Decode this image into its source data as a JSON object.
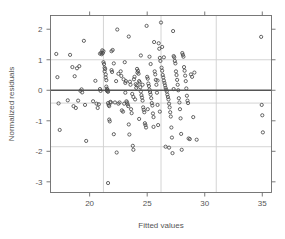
{
  "chart_data": {
    "type": "scatter",
    "title": "",
    "xlabel": "Fitted values",
    "ylabel": "Normalized residuals",
    "xlim": [
      16.6,
      35.8
    ],
    "ylim": [
      -3.35,
      2.45
    ],
    "xticks": [
      20,
      25,
      30,
      35
    ],
    "xtick_labels": [
      "20",
      "25",
      "30",
      "35"
    ],
    "yticks": [
      2,
      1,
      0,
      -1,
      -2,
      -3
    ],
    "ytick_labels": [
      "2",
      "1",
      "0",
      "-1",
      "-2",
      "-3"
    ],
    "grid": true,
    "grid_color": "#cfcfcf",
    "zero_line_y": 0,
    "zero_line_color": "#555555",
    "hgrid_values": [
      1.0,
      -0.42,
      -1.85
    ],
    "vgrid_values": [
      21.2,
      26.2,
      31.0
    ],
    "legend": null,
    "marker": "open-circle",
    "marker_color": "#4a4a4a",
    "marker_size": 3.2,
    "n_points": 208,
    "points": [
      [
        17.1,
        1.19
      ],
      [
        17.2,
        0.43
      ],
      [
        17.3,
        -0.43
      ],
      [
        17.4,
        -1.3
      ],
      [
        18.1,
        -0.33
      ],
      [
        18.3,
        1.16
      ],
      [
        18.5,
        0.76
      ],
      [
        18.6,
        -0.52
      ],
      [
        18.7,
        0.46
      ],
      [
        18.8,
        -0.58
      ],
      [
        18.9,
        0.72
      ],
      [
        19.0,
        -0.34
      ],
      [
        19.1,
        0.79
      ],
      [
        19.2,
        -0.02
      ],
      [
        19.3,
        0.03
      ],
      [
        19.35,
        -0.07
      ],
      [
        19.5,
        1.62
      ],
      [
        19.6,
        -0.48
      ],
      [
        19.7,
        -1.66
      ],
      [
        20.3,
        -0.36
      ],
      [
        20.5,
        0.31
      ],
      [
        20.6,
        -0.44
      ],
      [
        20.7,
        -0.58
      ],
      [
        20.8,
        -0.46
      ],
      [
        20.9,
        0.04
      ],
      [
        20.95,
        -0.02
      ],
      [
        21.0,
        1.23
      ],
      [
        21.05,
        1.18
      ],
      [
        21.1,
        1.31
      ],
      [
        21.15,
        1.22
      ],
      [
        21.2,
        1.28
      ],
      [
        21.2,
        0.92
      ],
      [
        21.25,
        0.86
      ],
      [
        21.3,
        0.74
      ],
      [
        21.3,
        0.62
      ],
      [
        21.35,
        0.7
      ],
      [
        21.4,
        0.52
      ],
      [
        21.4,
        0.42
      ],
      [
        21.45,
        0.33
      ],
      [
        21.45,
        0.12
      ],
      [
        21.5,
        0.05
      ],
      [
        21.5,
        -0.01
      ],
      [
        21.55,
        -0.03
      ],
      [
        21.55,
        0.02
      ],
      [
        21.6,
        -0.05
      ],
      [
        21.6,
        -0.42
      ],
      [
        21.65,
        -0.48
      ],
      [
        21.7,
        -0.52
      ],
      [
        21.7,
        -0.96
      ],
      [
        21.75,
        -1.02
      ],
      [
        21.8,
        -0.38
      ],
      [
        21.85,
        -0.4
      ],
      [
        21.9,
        0.66
      ],
      [
        21.95,
        0.6
      ],
      [
        22.0,
        1.32
      ],
      [
        22.1,
        0.88
      ],
      [
        22.2,
        -0.4
      ],
      [
        22.3,
        0.3
      ],
      [
        22.35,
        -2.04
      ],
      [
        22.4,
        1.99
      ],
      [
        22.5,
        -0.44
      ],
      [
        22.6,
        -0.4
      ],
      [
        22.7,
        0.62
      ],
      [
        22.75,
        0.47
      ],
      [
        22.8,
        -0.66
      ],
      [
        22.9,
        -0.7
      ],
      [
        23.0,
        -0.44
      ],
      [
        23.05,
        0.92
      ],
      [
        23.1,
        0.24
      ],
      [
        23.15,
        0.3
      ],
      [
        23.2,
        -0.36
      ],
      [
        23.25,
        -0.4
      ],
      [
        23.3,
        -0.46
      ],
      [
        23.35,
        -0.52
      ],
      [
        23.4,
        1.76
      ],
      [
        23.45,
        -1.45
      ],
      [
        23.5,
        0.28
      ],
      [
        23.55,
        0.18
      ],
      [
        23.6,
        -0.62
      ],
      [
        23.65,
        -0.75
      ],
      [
        23.7,
        -0.12
      ],
      [
        23.75,
        -1.82
      ],
      [
        23.8,
        -1.95
      ],
      [
        23.85,
        0.36
      ],
      [
        23.9,
        0.44
      ],
      [
        23.95,
        -0.3
      ],
      [
        24.0,
        0.2
      ],
      [
        24.05,
        0.08
      ],
      [
        24.1,
        0.16
      ],
      [
        24.15,
        0.58
      ],
      [
        24.2,
        0.64
      ],
      [
        24.25,
        0.54
      ],
      [
        24.3,
        0.3
      ],
      [
        24.35,
        0.26
      ],
      [
        24.4,
        0.1
      ],
      [
        24.45,
        -0.04
      ],
      [
        24.5,
        -0.16
      ],
      [
        24.55,
        -0.24
      ],
      [
        24.6,
        -0.34
      ],
      [
        24.65,
        -0.56
      ],
      [
        24.7,
        -0.64
      ],
      [
        24.75,
        -0.72
      ],
      [
        24.8,
        -1.08
      ],
      [
        24.85,
        -1.14
      ],
      [
        24.9,
        -1.22
      ],
      [
        24.95,
        2.11
      ],
      [
        25.0,
        0.44
      ],
      [
        25.05,
        0.38
      ],
      [
        25.1,
        0.22
      ],
      [
        25.15,
        0.14
      ],
      [
        25.2,
        0.02
      ],
      [
        25.25,
        -0.06
      ],
      [
        25.3,
        -0.14
      ],
      [
        25.35,
        -0.26
      ],
      [
        25.4,
        -0.42
      ],
      [
        25.45,
        -0.5
      ],
      [
        25.5,
        -0.76
      ],
      [
        25.55,
        -0.88
      ],
      [
        25.6,
        1.58
      ],
      [
        25.65,
        0.62
      ],
      [
        25.7,
        0.52
      ],
      [
        25.75,
        0.34
      ],
      [
        25.8,
        0.18
      ],
      [
        25.85,
        -0.08
      ],
      [
        25.9,
        -0.48
      ],
      [
        25.95,
        -1.14
      ],
      [
        26.0,
        1.54
      ],
      [
        26.05,
        1.36
      ],
      [
        26.1,
        1.06
      ],
      [
        26.15,
        0.96
      ],
      [
        26.2,
        2.22
      ],
      [
        26.25,
        0.74
      ],
      [
        26.3,
        0.64
      ],
      [
        26.35,
        0.5
      ],
      [
        26.4,
        0.42
      ],
      [
        26.45,
        0.32
      ],
      [
        26.5,
        0.24
      ],
      [
        26.55,
        0.16
      ],
      [
        26.6,
        0.08
      ],
      [
        26.65,
        0.02
      ],
      [
        26.7,
        -0.04
      ],
      [
        26.75,
        -0.14
      ],
      [
        26.8,
        -0.22
      ],
      [
        26.85,
        -0.3
      ],
      [
        26.9,
        -0.44
      ],
      [
        26.95,
        -0.56
      ],
      [
        27.0,
        -0.72
      ],
      [
        27.05,
        -0.86
      ],
      [
        27.1,
        -1.22
      ],
      [
        27.15,
        -1.55
      ],
      [
        27.2,
        -2.06
      ],
      [
        27.25,
        1.94
      ],
      [
        27.3,
        1.12
      ],
      [
        27.35,
        1.08
      ],
      [
        27.4,
        0.96
      ],
      [
        27.45,
        0.88
      ],
      [
        27.5,
        0.62
      ],
      [
        27.55,
        0.5
      ],
      [
        27.6,
        0.34
      ],
      [
        27.65,
        0.18
      ],
      [
        27.7,
        0.0
      ],
      [
        27.75,
        -0.26
      ],
      [
        27.8,
        -0.4
      ],
      [
        27.85,
        -0.62
      ],
      [
        27.9,
        -0.92
      ],
      [
        27.95,
        -1.43
      ],
      [
        28.0,
        -1.95
      ],
      [
        28.05,
        1.22
      ],
      [
        28.1,
        1.16
      ],
      [
        28.15,
        1.1
      ],
      [
        28.2,
        0.76
      ],
      [
        28.25,
        0.64
      ],
      [
        28.3,
        0.48
      ],
      [
        28.35,
        0.3
      ],
      [
        28.4,
        0.06
      ],
      [
        28.45,
        -0.18
      ],
      [
        28.5,
        -0.34
      ],
      [
        28.55,
        -0.42
      ],
      [
        28.6,
        -1.58
      ],
      [
        28.7,
        -1.6
      ],
      [
        28.8,
        0.52
      ],
      [
        28.9,
        0.44
      ],
      [
        29.0,
        -0.88
      ],
      [
        29.1,
        0.58
      ],
      [
        29.3,
        -1.62
      ],
      [
        21.6,
        -3.04
      ],
      [
        20.9,
        1.2
      ],
      [
        22.95,
        0.36
      ],
      [
        24.12,
        0.7
      ],
      [
        25.3,
        0.86
      ],
      [
        26.45,
        1.08
      ],
      [
        23.1,
        -0.08
      ],
      [
        24.6,
        0.18
      ],
      [
        25.9,
        0.32
      ],
      [
        22.5,
        0.54
      ],
      [
        23.8,
        -0.22
      ],
      [
        25.05,
        -0.62
      ],
      [
        26.1,
        -0.7
      ],
      [
        27.3,
        0.04
      ],
      [
        24.3,
        -0.94
      ],
      [
        23.4,
        -1.12
      ],
      [
        25.55,
        -1.2
      ],
      [
        26.6,
        -1.85
      ],
      [
        22.1,
        -1.44
      ],
      [
        26.9,
        -1.88
      ],
      [
        34.9,
        1.75
      ],
      [
        34.95,
        -0.48
      ],
      [
        35.0,
        -0.82
      ],
      [
        35.05,
        -1.38
      ],
      [
        24.45,
        1.14
      ],
      [
        25.2,
        1.1
      ],
      [
        26.3,
        1.42
      ],
      [
        21.9,
        1.28
      ]
    ]
  }
}
